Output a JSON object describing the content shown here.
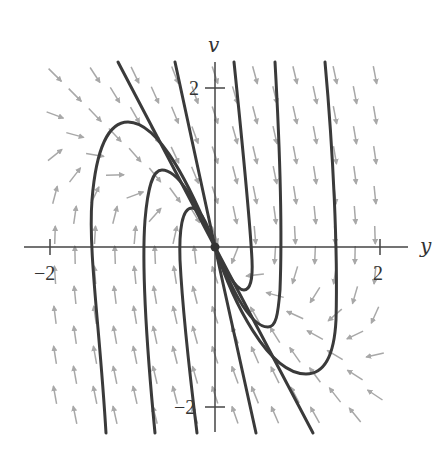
{
  "figure": {
    "type": "phase-plane",
    "x_axis": {
      "label": "y",
      "ticks": [
        {
          "value": -2,
          "label": "−2"
        },
        {
          "value": 2,
          "label": "2"
        }
      ]
    },
    "y_axis": {
      "label": "v",
      "ticks": [
        {
          "value": 2,
          "label": "2"
        },
        {
          "value": -2,
          "label": "−2"
        }
      ]
    },
    "colors": {
      "trajectory": "#3a3a3a",
      "arrow": "#a8a8a8",
      "axis": "#444444",
      "equilibrium": "#333333"
    },
    "equilibrium": {
      "y": 0,
      "v": 0,
      "label": "node at origin"
    },
    "trajectories": [
      {
        "name": "straight-line-slow",
        "points": [
          [
            118,
            62
          ],
          [
            215,
            247
          ],
          [
            313,
            433
          ]
        ]
      },
      {
        "name": "straight-line-fast",
        "points": [
          [
            175,
            62
          ],
          [
            215,
            247
          ],
          [
            256,
            433
          ]
        ]
      },
      {
        "name": "left-outer",
        "path": "M106,433 C100,330 88,250 92,200 C96,150 108,122 128,122 C160,122 192,190 215,247"
      },
      {
        "name": "left-middle",
        "path": "M155,433 C146,340 142,260 145,220 C148,185 153,170 162,170 C180,170 200,210 215,247"
      },
      {
        "name": "left-inner",
        "path": "M197,433 C188,360 182,300 180,260 C179,230 182,208 192,208 C202,208 210,232 215,247"
      },
      {
        "name": "right-inner",
        "path": "M234,62 C242,140 250,220 252,260 C253,280 250,290 244,290 C234,290 222,262 215,247"
      },
      {
        "name": "right-middle",
        "path": "M275,62 C280,150 282,240 280,290 C278,315 276,327 268,327 C248,327 228,280 215,247"
      },
      {
        "name": "right-outer",
        "path": "M325,62 C333,150 338,250 336,320 C334,360 322,374 306,374 C268,374 232,300 215,247"
      }
    ],
    "field": {
      "origin_px": [
        215,
        247
      ],
      "scale_px": [
        82.5,
        80
      ],
      "x_range_px": [
        50,
        385
      ],
      "y_range_px": [
        75,
        420
      ],
      "column_spacing_px": 20,
      "row_spacing_px": 40,
      "arrow_length_px": 18
    }
  }
}
